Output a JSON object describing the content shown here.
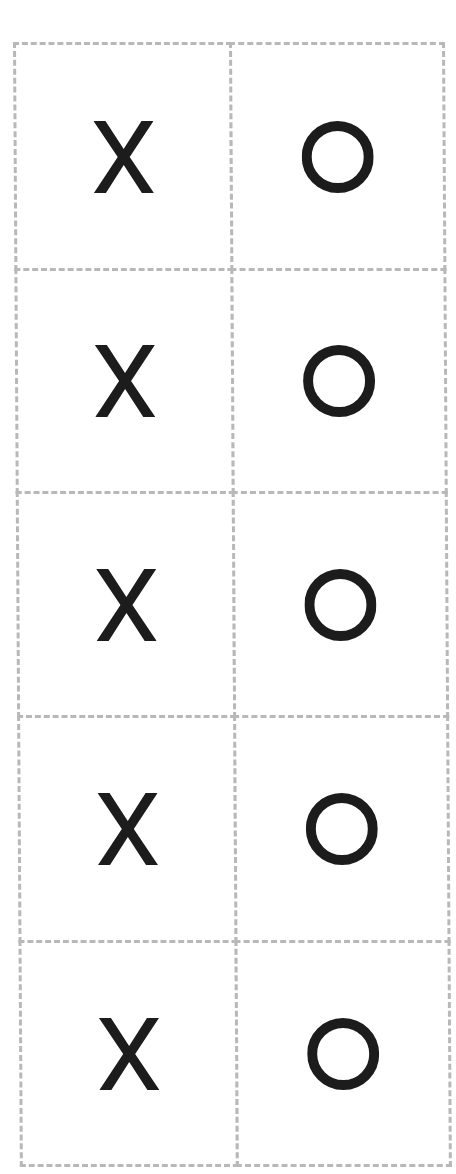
{
  "board": {
    "rows": 5,
    "columns": 2,
    "grid_line_color": "#b8b8b8",
    "grid_line_style": "dashed",
    "mark_color": "#1c1c1c",
    "cells": [
      [
        "X",
        "O"
      ],
      [
        "X",
        "O"
      ],
      [
        "X",
        "O"
      ],
      [
        "X",
        "O"
      ],
      [
        "X",
        "O"
      ]
    ]
  },
  "icons": {
    "X": "x-mark-icon",
    "O": "o-mark-icon"
  }
}
